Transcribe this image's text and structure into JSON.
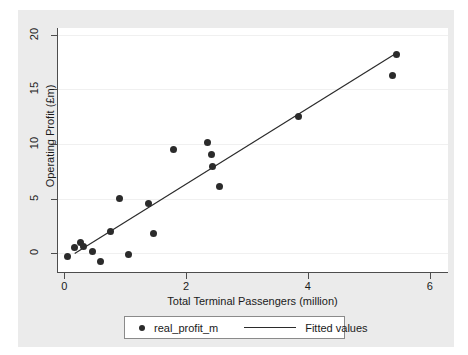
{
  "chart_data": {
    "type": "scatter",
    "title": "",
    "xlabel": "Total Terminal Passengers (million)",
    "ylabel": "Operating Profit (£m)",
    "xlim": [
      -0.12,
      6.3
    ],
    "ylim": [
      -1.7,
      20.6
    ],
    "xticks": [
      0,
      2,
      4,
      6
    ],
    "xtick_labels": [
      "0",
      "2",
      "4",
      "6"
    ],
    "yticks": [
      0,
      5,
      10,
      15,
      20
    ],
    "ytick_labels": [
      "0",
      "5",
      "10",
      "15",
      "20"
    ],
    "grid": "horizontal",
    "series": [
      {
        "name": "real_profit_m",
        "type": "scatter",
        "marker": "circle",
        "color": "#2b2b2b",
        "points": [
          {
            "x": 0.05,
            "y": -0.3
          },
          {
            "x": 0.16,
            "y": 0.5
          },
          {
            "x": 0.26,
            "y": 1.0
          },
          {
            "x": 0.31,
            "y": 0.6
          },
          {
            "x": 0.46,
            "y": 0.15
          },
          {
            "x": 0.6,
            "y": -0.7
          },
          {
            "x": 0.76,
            "y": 2.0
          },
          {
            "x": 0.91,
            "y": 5.0
          },
          {
            "x": 1.06,
            "y": -0.1
          },
          {
            "x": 1.39,
            "y": 4.6
          },
          {
            "x": 1.46,
            "y": 1.8
          },
          {
            "x": 1.8,
            "y": 9.5
          },
          {
            "x": 2.35,
            "y": 10.1
          },
          {
            "x": 2.41,
            "y": 9.0
          },
          {
            "x": 2.44,
            "y": 7.9
          },
          {
            "x": 2.54,
            "y": 6.1
          },
          {
            "x": 3.85,
            "y": 12.5
          },
          {
            "x": 5.39,
            "y": 16.3
          },
          {
            "x": 5.45,
            "y": 18.2
          }
        ]
      },
      {
        "name": "Fitted values",
        "type": "line",
        "color": "#2b2b2b",
        "endpoints": [
          {
            "x": 0.17,
            "y": 0.0
          },
          {
            "x": 5.45,
            "y": 18.3
          }
        ]
      }
    ],
    "legend": {
      "position": "bottom",
      "entries": [
        {
          "label": "real_profit_m",
          "marker": "circle"
        },
        {
          "label": "Fitted values",
          "marker": "line"
        }
      ]
    }
  },
  "colors": {
    "figure_background": "#ffffff",
    "graph_background": "#ebebeb",
    "plot_background": "#ffffff",
    "axis": "#4d4d4d",
    "gridline": "#f0f0f0",
    "marker": "#2b2b2b"
  }
}
